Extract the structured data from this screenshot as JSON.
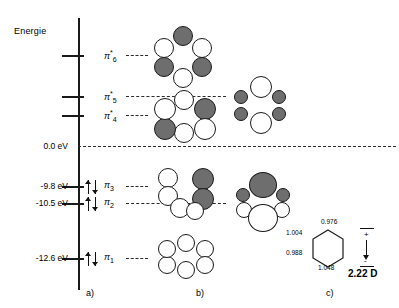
{
  "figure": {
    "axis_title": "Energie",
    "zero_label": "0.0 eV",
    "panels": [
      {
        "id": "a",
        "tag": "a)"
      },
      {
        "id": "b",
        "tag": "b)"
      },
      {
        "id": "c",
        "tag": "c)"
      }
    ]
  },
  "energy_levels": [
    {
      "name": "pi6-star",
      "label": "π",
      "sub": "6",
      "star": "*",
      "energy_label": "",
      "occupancy": 0,
      "y": 55
    },
    {
      "name": "pi5-star",
      "label": "π",
      "sub": "5",
      "star": "*",
      "energy_label": "",
      "occupancy": 0,
      "y": 96
    },
    {
      "name": "pi4-star",
      "label": "π",
      "sub": "4",
      "star": "*",
      "energy_label": "",
      "occupancy": 0,
      "y": 115
    },
    {
      "name": "pi3",
      "label": "π",
      "sub": "3",
      "star": "",
      "energy_label": "-9.8 eV",
      "occupancy": 2,
      "y": 186
    },
    {
      "name": "pi2",
      "label": "π",
      "sub": "2",
      "star": "",
      "energy_label": "-10.5 eV",
      "occupancy": 2,
      "y": 203
    },
    {
      "name": "pi1",
      "label": "π",
      "sub": "1",
      "star": "",
      "energy_label": "-12.6 eV",
      "occupancy": 2,
      "y": 258
    }
  ],
  "charges": {
    "top": "0.976",
    "upper_left": "1.004",
    "lower_left": "0.988",
    "bottom": "1.048"
  },
  "dipole": {
    "value": "2.22 D",
    "positive_sign": "+",
    "negative_sign": "-"
  }
}
